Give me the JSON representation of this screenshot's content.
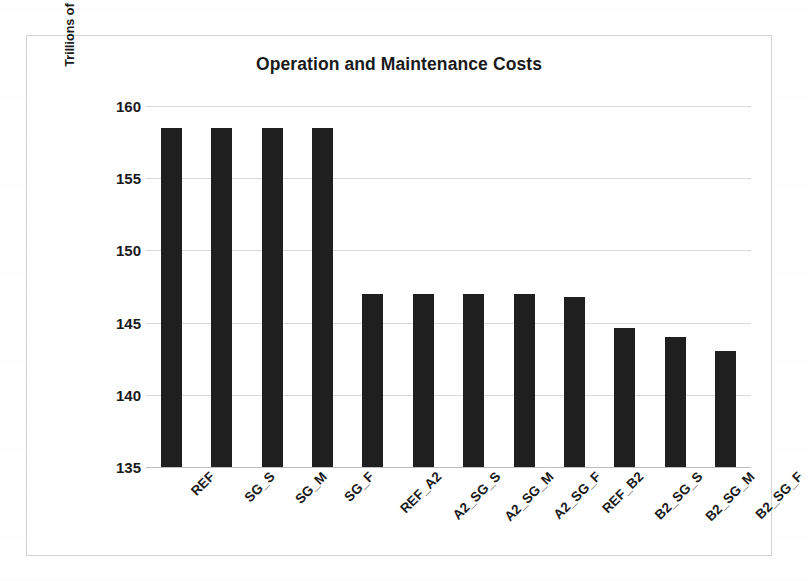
{
  "chart_data": {
    "type": "bar",
    "title": "Operation and Maintenance Costs",
    "xlabel": "",
    "ylabel": "Trillions of R$",
    "ylim": [
      135,
      160
    ],
    "yticks": [
      135,
      140,
      145,
      150,
      155,
      160
    ],
    "grid": true,
    "legend": false,
    "bar_color": "#1f1f1f",
    "categories": [
      "REF",
      "SG_S",
      "SG_M",
      "SG_F",
      "REF_A2",
      "A2_SG_S",
      "A2_SG_M",
      "A2_SG_F",
      "REF_B2",
      "B2_SG_S",
      "B2_SG_M",
      "B2_SG_F"
    ],
    "values": [
      158.5,
      158.5,
      158.5,
      158.5,
      147.0,
      147.0,
      147.0,
      147.0,
      146.8,
      144.6,
      144.0,
      143.0
    ]
  }
}
